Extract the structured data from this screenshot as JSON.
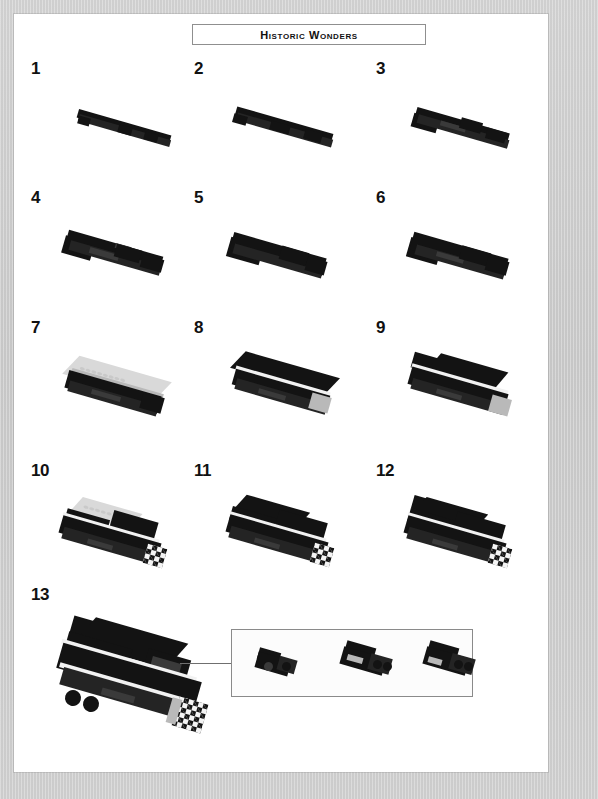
{
  "page": {
    "title": "Historic Wonders",
    "background_color": "#cdcdcd",
    "paper_color": "#ffffff",
    "width": 598,
    "height": 799
  },
  "colors": {
    "brick_black": "#131313",
    "brick_dark_grey": "#3a3a3a",
    "brick_light_grey": "#b9b9b9",
    "brick_white": "#f2f2f2",
    "outline": "#8a8a8a",
    "leader_line": "#6f6f6f"
  },
  "steps": [
    {
      "number": "1",
      "description": "long black plate"
    },
    {
      "number": "2",
      "description": "black plate with added bricks"
    },
    {
      "number": "3",
      "description": "black chassis with grey detail"
    },
    {
      "number": "4",
      "description": "widened chassis with grey plates"
    },
    {
      "number": "5",
      "description": "black chassis assembly"
    },
    {
      "number": "6",
      "description": "black chassis with side detail"
    },
    {
      "number": "7",
      "description": "light grey plate added on top"
    },
    {
      "number": "8",
      "description": "black body with white stripe"
    },
    {
      "number": "9",
      "description": "locomotive body with grey front"
    },
    {
      "number": "10",
      "description": "grey roof plate and checkered front"
    },
    {
      "number": "11",
      "description": "black hood with checkered front"
    },
    {
      "number": "12",
      "description": "cab detail with grey elements"
    },
    {
      "number": "13",
      "description": "completed black locomotive"
    }
  ],
  "callout": {
    "label": "sub-assembly detail",
    "sub_steps": [
      {
        "index": "1",
        "description": "black brick with side stud"
      },
      {
        "index": "2",
        "description": "black bricks with headlight plates"
      },
      {
        "index": "3",
        "description": "black bricks assembled with studs"
      }
    ]
  }
}
